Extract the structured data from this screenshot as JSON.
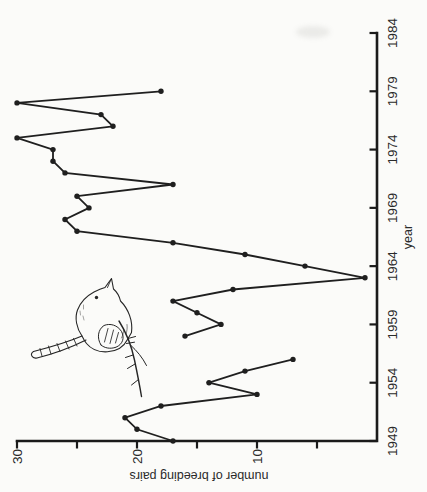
{
  "chart_data": {
    "type": "line",
    "title": "",
    "xlabel": "year",
    "ylabel": "number of breeding pairs",
    "x": [
      1949,
      1950,
      1951,
      1952,
      1953,
      1954,
      1955,
      1956,
      1957,
      1958,
      1959,
      1960,
      1961,
      1962,
      1963,
      1964,
      1965,
      1966,
      1967,
      1968,
      1969,
      1970,
      1971,
      1972,
      1973,
      1974,
      1975,
      1976,
      1977,
      1978,
      1979
    ],
    "values": [
      17,
      20,
      21,
      18,
      10,
      14,
      11,
      7,
      null,
      16,
      13,
      15,
      17,
      12,
      1,
      6,
      11,
      17,
      25,
      26,
      24,
      25,
      17,
      26,
      27,
      27,
      30,
      22,
      23,
      30,
      18
    ],
    "xlim": [
      1949,
      1984
    ],
    "ylim": [
      0,
      30
    ],
    "xticks": [
      1949,
      1954,
      1959,
      1964,
      1969,
      1974,
      1979,
      1984
    ],
    "yticks": [
      5,
      10,
      15,
      20,
      25,
      30
    ],
    "ytick_labels_shown": [
      10,
      20,
      30
    ],
    "grid": false,
    "marker": "filled-dot",
    "line_color": "#1f1f1f",
    "axis_color": "#1a1a1a",
    "annotations": [
      "hand-drawn wren perched on a twig inside the plot area"
    ],
    "orientation": "entire figure rotated 90 degrees counter-clockwise; years read bottom-to-top along right edge, pairs axis reads right-to-left along bottom"
  }
}
